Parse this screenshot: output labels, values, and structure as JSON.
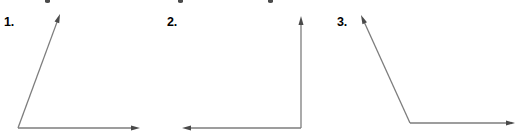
{
  "page": {
    "width": 523,
    "height": 138,
    "background_color": "#ffffff"
  },
  "style": {
    "ray_color": "#7d7d7d",
    "arrowhead_color": "#4a4a4a",
    "label_color": "#000000",
    "ray_width": 1.3
  },
  "figures": [
    {
      "label": "1.",
      "name": "acute-angle",
      "vertex": {
        "x": 18,
        "y": 128
      },
      "rays": [
        {
          "name": "horizontal-ray-right",
          "tip": {
            "x": 140,
            "y": 128
          },
          "arrow": true
        },
        {
          "name": "slanted-ray-up-right",
          "tip": {
            "x": 60,
            "y": 14
          },
          "arrow": true
        }
      ]
    },
    {
      "label": "2.",
      "name": "right-angle",
      "vertex": {
        "x": 301,
        "y": 128
      },
      "rays": [
        {
          "name": "horizontal-ray-left",
          "tip": {
            "x": 182,
            "y": 128
          },
          "arrow": true
        },
        {
          "name": "vertical-ray-up",
          "tip": {
            "x": 301,
            "y": 16
          },
          "arrow": true
        }
      ]
    },
    {
      "label": "3.",
      "name": "obtuse-angle",
      "vertex": {
        "x": 410,
        "y": 123
      },
      "rays": [
        {
          "name": "horizontal-ray-right",
          "tip": {
            "x": 515,
            "y": 123
          },
          "arrow": true
        },
        {
          "name": "slanted-ray-up-left",
          "tip": {
            "x": 361,
            "y": 15
          },
          "arrow": true
        }
      ]
    }
  ]
}
